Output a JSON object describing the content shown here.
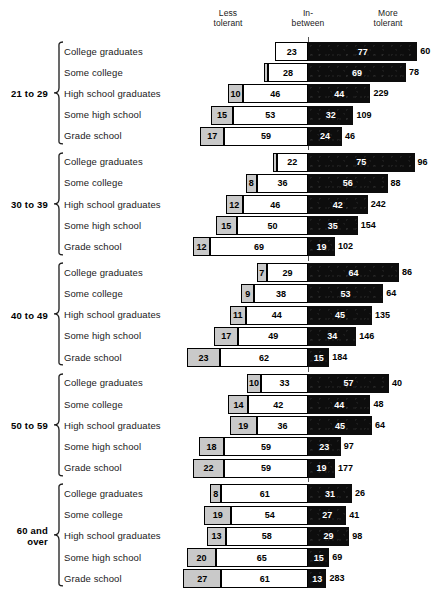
{
  "headers": {
    "less": "Less\ntolerant",
    "inbetween": "In-\nbetween",
    "more": "More\ntolerant"
  },
  "education_levels": [
    "College graduates",
    "Some college",
    "High school graduates",
    "Some high school",
    "Grade school"
  ],
  "chart_data": {
    "type": "bar",
    "subtype": "diverging-stacked-bar",
    "title": "",
    "xlabel": "",
    "ylabel": "",
    "legend": [
      "Less tolerant",
      "In-between",
      "More tolerant"
    ],
    "legend_position": "top",
    "grid": false,
    "axis_note": "Bars are aligned at the right edge of the In-between segment (the 'More tolerant' baseline). Outer numbers are sample sizes (N).",
    "categories": [
      "College graduates",
      "Some college",
      "High school graduates",
      "Some high school",
      "Grade school"
    ],
    "groups": [
      {
        "age": "21 to 29",
        "age_label": "21 to 29",
        "rows": [
          {
            "education": "College graduates",
            "less": 0,
            "less_label": "",
            "inbetween": 23,
            "more": 77,
            "n": 60
          },
          {
            "education": "Some college",
            "less": 3,
            "less_label": "",
            "inbetween": 28,
            "more": 69,
            "n": 78
          },
          {
            "education": "High school graduates",
            "less": 10,
            "less_label": "10",
            "inbetween": 46,
            "more": 44,
            "n": 229
          },
          {
            "education": "Some high school",
            "less": 15,
            "less_label": "15",
            "inbetween": 53,
            "more": 32,
            "n": 109
          },
          {
            "education": "Grade school",
            "less": 17,
            "less_label": "17",
            "inbetween": 59,
            "more": 24,
            "n": 46
          }
        ]
      },
      {
        "age": "30 to 39",
        "age_label": "30 to 39",
        "rows": [
          {
            "education": "College graduates",
            "less": 3,
            "less_label": "",
            "inbetween": 22,
            "more": 75,
            "n": 96
          },
          {
            "education": "Some college",
            "less": 8,
            "less_label": "8",
            "inbetween": 36,
            "more": 56,
            "n": 88
          },
          {
            "education": "High school graduates",
            "less": 12,
            "less_label": "12",
            "inbetween": 46,
            "more": 42,
            "n": 242
          },
          {
            "education": "Some high school",
            "less": 15,
            "less_label": "15",
            "inbetween": 50,
            "more": 35,
            "n": 154
          },
          {
            "education": "Grade school",
            "less": 12,
            "less_label": "12",
            "inbetween": 69,
            "more": 19,
            "n": 102
          }
        ]
      },
      {
        "age": "40 to 49",
        "age_label": "40 to 49",
        "rows": [
          {
            "education": "College graduates",
            "less": 7,
            "less_label": "7",
            "inbetween": 29,
            "more": 64,
            "n": 86
          },
          {
            "education": "Some college",
            "less": 9,
            "less_label": "9",
            "inbetween": 38,
            "more": 53,
            "n": 64
          },
          {
            "education": "High school graduates",
            "less": 11,
            "less_label": "11",
            "inbetween": 44,
            "more": 45,
            "n": 135
          },
          {
            "education": "Some high school",
            "less": 17,
            "less_label": "17",
            "inbetween": 49,
            "more": 34,
            "n": 146
          },
          {
            "education": "Grade school",
            "less": 23,
            "less_label": "23",
            "inbetween": 62,
            "more": 15,
            "n": 184
          }
        ]
      },
      {
        "age": "50 to 59",
        "age_label": "50 to 59",
        "rows": [
          {
            "education": "College graduates",
            "less": 10,
            "less_label": "10",
            "inbetween": 33,
            "more": 57,
            "n": 40
          },
          {
            "education": "Some college",
            "less": 14,
            "less_label": "14",
            "inbetween": 42,
            "more": 44,
            "n": 48
          },
          {
            "education": "High school graduates",
            "less": 19,
            "less_label": "19",
            "inbetween": 36,
            "more": 45,
            "n": 64
          },
          {
            "education": "Some high school",
            "less": 18,
            "less_label": "18",
            "inbetween": 59,
            "more": 23,
            "n": 97
          },
          {
            "education": "Grade school",
            "less": 22,
            "less_label": "22",
            "inbetween": 59,
            "more": 19,
            "n": 177
          }
        ]
      },
      {
        "age": "60 and over",
        "age_label": "60 and\nover",
        "rows": [
          {
            "education": "College graduates",
            "less": 8,
            "less_label": "8",
            "inbetween": 61,
            "more": 31,
            "n": 26
          },
          {
            "education": "Some college",
            "less": 19,
            "less_label": "19",
            "inbetween": 54,
            "more": 27,
            "n": 41
          },
          {
            "education": "High school graduates",
            "less": 13,
            "less_label": "13",
            "inbetween": 58,
            "more": 29,
            "n": 98
          },
          {
            "education": "Some high school",
            "less": 20,
            "less_label": "20",
            "inbetween": 65,
            "more": 15,
            "n": 69
          },
          {
            "education": "Grade school",
            "less": 27,
            "less_label": "27",
            "inbetween": 61,
            "more": 13,
            "n": 283
          }
        ]
      }
    ]
  }
}
